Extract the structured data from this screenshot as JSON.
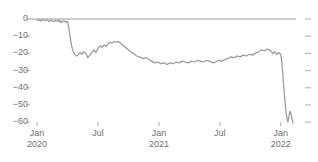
{
  "figure": {
    "clipped_header_text": "",
    "background_color": "#ffffff"
  },
  "chart_data": {
    "type": "line",
    "title": "",
    "subtitle": "",
    "xlabel": "",
    "ylabel": "",
    "grid": false,
    "legend": false,
    "legend_position": "none",
    "line_color": "#9a9a9a",
    "zero_line_color": "#8f8f8f",
    "tick_color": "#a6a6a6",
    "ylim": [
      -64,
      4
    ],
    "yticks": [
      0,
      -10,
      -20,
      -30,
      -40,
      -50,
      -60
    ],
    "ytick_labels": [
      "0",
      "−10",
      "−20",
      "−30",
      "−40",
      "−50",
      "−60"
    ],
    "right_axis_ticks": [
      0,
      -10,
      -20,
      -30,
      -40,
      -50,
      -60
    ],
    "right_axis_labels": false,
    "xticks": [
      0,
      6,
      12,
      18,
      24
    ],
    "xtick_labels": [
      "Jan",
      "Jul",
      "Jan",
      "Jul",
      "Jan"
    ],
    "xtick_sublabels": [
      "2020",
      "",
      "2021",
      "",
      "2022"
    ],
    "xlim": [
      -0.6,
      25.4
    ],
    "x_unit": "months since Jan 2020",
    "series": [
      {
        "name": "index",
        "color": "#9a9a9a",
        "x": [
          0.0,
          0.2,
          0.4,
          0.6,
          0.8,
          1.0,
          1.2,
          1.4,
          1.6,
          1.8,
          2.0,
          2.1,
          2.2,
          2.3,
          2.4,
          2.5,
          2.6,
          2.7,
          2.8,
          2.9,
          3.0,
          3.1,
          3.2,
          3.3,
          3.4,
          3.5,
          3.6,
          3.7,
          3.8,
          3.9,
          4.0,
          4.2,
          4.4,
          4.6,
          4.8,
          5.0,
          5.2,
          5.4,
          5.6,
          5.8,
          6.0,
          6.2,
          6.4,
          6.6,
          6.8,
          7.0,
          7.2,
          7.4,
          7.6,
          7.8,
          8.0,
          8.3,
          8.6,
          8.9,
          9.2,
          9.5,
          9.8,
          10.1,
          10.4,
          10.7,
          11.0,
          11.3,
          11.6,
          11.9,
          12.2,
          12.5,
          12.8,
          13.1,
          13.4,
          13.7,
          14.0,
          14.3,
          14.6,
          14.9,
          15.2,
          15.5,
          15.8,
          16.1,
          16.4,
          16.7,
          17.0,
          17.3,
          17.6,
          17.9,
          18.2,
          18.5,
          18.8,
          19.1,
          19.4,
          19.7,
          20.0,
          20.3,
          20.6,
          20.9,
          21.2,
          21.5,
          21.8,
          22.1,
          22.4,
          22.7,
          23.0,
          23.2,
          23.4,
          23.6,
          23.8,
          24.0,
          24.1,
          24.2,
          24.3,
          24.4,
          24.5,
          24.6,
          24.7,
          24.8,
          24.9,
          25.0,
          25.1,
          25.2
        ],
        "y": [
          -0.8,
          -0.5,
          -1.2,
          -0.4,
          -1.0,
          -0.6,
          -1.4,
          -0.7,
          -1.5,
          -0.9,
          -1.2,
          -0.5,
          -1.8,
          -1.0,
          -2.2,
          -1.3,
          -1.1,
          -1.6,
          -1.2,
          -1.8,
          -1.5,
          -4.0,
          -8.5,
          -12.0,
          -15.5,
          -18.0,
          -19.5,
          -20.5,
          -21.0,
          -21.5,
          -21.0,
          -19.5,
          -20.5,
          -19.0,
          -20.0,
          -22.5,
          -21.0,
          -19.5,
          -18.0,
          -19.5,
          -17.0,
          -15.5,
          -16.5,
          -15.0,
          -16.0,
          -14.5,
          -13.5,
          -14.0,
          -13.0,
          -13.5,
          -13.0,
          -14.5,
          -16.0,
          -17.5,
          -19.0,
          -20.0,
          -21.5,
          -22.0,
          -23.0,
          -22.5,
          -23.5,
          -24.5,
          -25.5,
          -25.0,
          -26.0,
          -25.5,
          -26.5,
          -25.5,
          -26.0,
          -25.0,
          -25.5,
          -24.5,
          -25.0,
          -25.5,
          -24.5,
          -25.0,
          -24.0,
          -24.5,
          -25.0,
          -24.0,
          -24.5,
          -25.5,
          -25.0,
          -24.0,
          -24.5,
          -23.5,
          -23.0,
          -22.0,
          -22.5,
          -21.5,
          -22.0,
          -21.0,
          -21.5,
          -20.5,
          -21.0,
          -20.0,
          -19.0,
          -18.0,
          -18.5,
          -17.5,
          -18.5,
          -20.0,
          -19.0,
          -20.5,
          -19.5,
          -20.5,
          -25.0,
          -32.0,
          -40.0,
          -47.0,
          -53.0,
          -57.5,
          -60.0,
          -57.0,
          -53.5,
          -55.0,
          -58.0,
          -60.5
        ]
      }
    ],
    "annotations": [
      {
        "text": "sharp decline early 2020",
        "approx_x": 3.0,
        "approx_y": -21.0
      },
      {
        "text": "terminal collapse at end of series",
        "approx_x": 25.0,
        "approx_y": -60.0
      }
    ]
  }
}
